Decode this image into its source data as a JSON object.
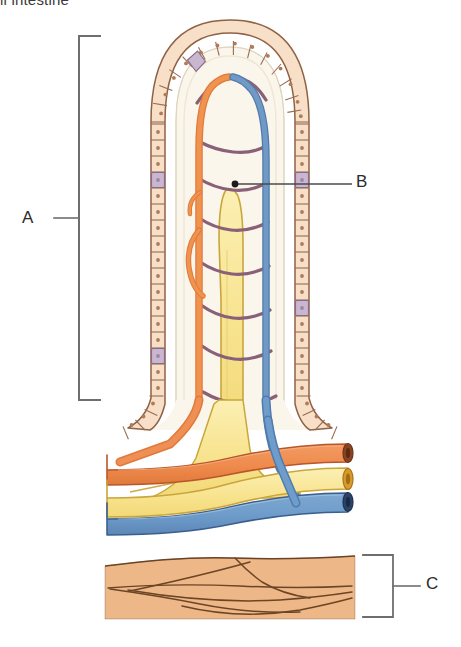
{
  "figure": {
    "title_clipped": "ll intestine",
    "background_color": "#ffffff"
  },
  "labels": [
    {
      "id": "A",
      "text": "A",
      "refers_to": "villus",
      "bracket": true
    },
    {
      "id": "B",
      "text": "B",
      "refers_to": "lacteal",
      "bracket": false
    },
    {
      "id": "C",
      "text": "C",
      "refers_to": "muscle-layer",
      "bracket": true
    }
  ],
  "structures": {
    "epithelium": {
      "name": "epithelial-cell-layer",
      "color": "#f7ddc4",
      "outline": "#9a6b50"
    },
    "goblet_cells": {
      "name": "goblet-cells",
      "color": "#c9b6cf",
      "outline": "#8a6a8c"
    },
    "lamina_propria": {
      "name": "lamina-propria",
      "color": "#fbf6ec"
    },
    "lacteal": {
      "name": "lacteal-lymph-vessel",
      "color": "#f7e48f",
      "outline": "#c8a63a"
    },
    "arteriole": {
      "name": "arteriole",
      "color": "#ef8f54",
      "outline": "#b9562a"
    },
    "venule": {
      "name": "venule",
      "color": "#6e9ccb",
      "outline": "#3a5f8f"
    },
    "capillary_network": {
      "name": "capillary-network",
      "color": "#8a6078"
    },
    "muscle_layer": {
      "name": "muscle-layer",
      "color": "#eeb787",
      "outline": "#6b4526"
    }
  },
  "colors": {
    "label_text": "#2b2b2b",
    "bracket": "#6e6e6e",
    "leader_line": "#4a4a4a",
    "title_text": "#3a3a3a"
  }
}
